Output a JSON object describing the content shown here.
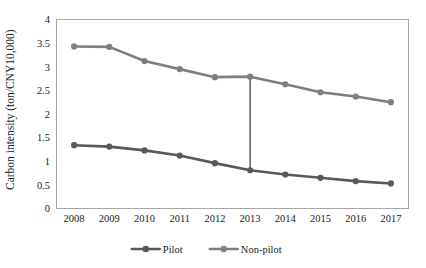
{
  "chart_data": {
    "type": "line",
    "title": "",
    "xlabel": "",
    "ylabel": "Carbon intensity (ton/CNY10,000)",
    "categories": [
      "2008",
      "2009",
      "2010",
      "2011",
      "2012",
      "2013",
      "2014",
      "2015",
      "2016",
      "2017"
    ],
    "x": [
      2008,
      2009,
      2010,
      2011,
      2012,
      2013,
      2014,
      2015,
      2016,
      2017
    ],
    "ylim": [
      0,
      4
    ],
    "ytick_values": [
      0,
      0.5,
      1,
      1.5,
      2,
      2.5,
      3,
      3.5,
      4
    ],
    "ytick_labels": [
      "0",
      "0.5",
      "1",
      "1.5",
      "2",
      "2.5",
      "3",
      "3.5",
      "4"
    ],
    "grid": false,
    "legend_position": "bottom",
    "series": [
      {
        "name": "Pilot",
        "color": "#595959",
        "marker": "circle",
        "values": [
          1.34,
          1.31,
          1.23,
          1.12,
          0.96,
          0.81,
          0.72,
          0.65,
          0.58,
          0.53
        ]
      },
      {
        "name": "Non-pilot",
        "color": "#7f7f7f",
        "marker": "circle",
        "values": [
          3.43,
          3.42,
          3.12,
          2.95,
          2.78,
          2.79,
          2.63,
          2.46,
          2.37,
          2.25
        ]
      }
    ],
    "annotations": [
      {
        "type": "vertical-line",
        "at_category": "2013",
        "from_value": 0.81,
        "to_value": 2.79,
        "color": "#404040"
      }
    ]
  },
  "legend": {
    "items": [
      {
        "label": "Pilot",
        "color": "#595959"
      },
      {
        "label": "Non-pilot",
        "color": "#7f7f7f"
      }
    ]
  }
}
